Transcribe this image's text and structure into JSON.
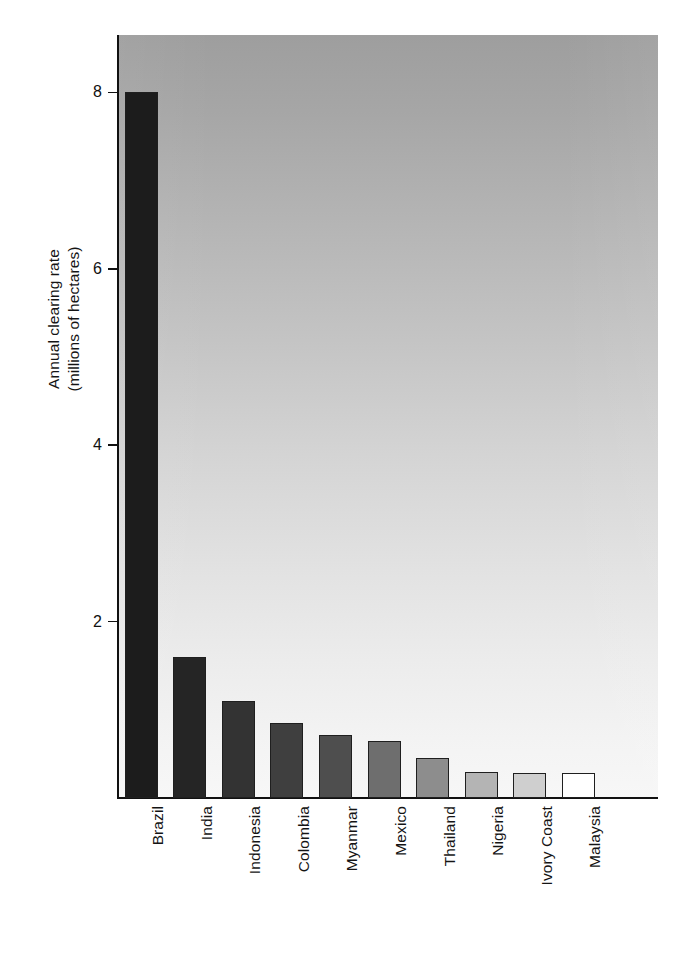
{
  "chart_data": {
    "type": "bar",
    "title": "",
    "subtitle": "",
    "xlabel": "",
    "ylabel": "Annual clearing rate (millions of hectares)",
    "ylabel_lines": [
      "Annual clearing rate",
      "(millions of hectares)"
    ],
    "categories": [
      "Brazil",
      "India",
      "Indonesia",
      "Colombia",
      "Myanmar",
      "Mexico",
      "Thailand",
      "Nigeria",
      "Ivory Coast",
      "Malaysia"
    ],
    "values": [
      8.0,
      1.6,
      1.1,
      0.85,
      0.72,
      0.65,
      0.45,
      0.3,
      0.28,
      0.28
    ],
    "bar_colors": [
      "#1c1c1c",
      "#252525",
      "#333333",
      "#3f3f3f",
      "#4e4e4e",
      "#6e6e6e",
      "#8d8d8d",
      "#b4b4b4",
      "#cfcfcf",
      "#ffffff"
    ],
    "ylim": [
      0,
      8.65
    ],
    "yticks": [
      2,
      4,
      6,
      8
    ],
    "ytick_labels": [
      "2",
      "4",
      "6",
      "8"
    ],
    "grid": false,
    "legend": false,
    "legend_position": "none",
    "plot_background": "vertical gradient dark gray (top) to near-white (bottom)",
    "axis_color": "#111111",
    "tick_direction": "out"
  },
  "figure": {
    "background_color": "#ffffff",
    "plot_bg_top": "#9e9e9e",
    "plot_bg_bottom": "#f7f7f7"
  }
}
